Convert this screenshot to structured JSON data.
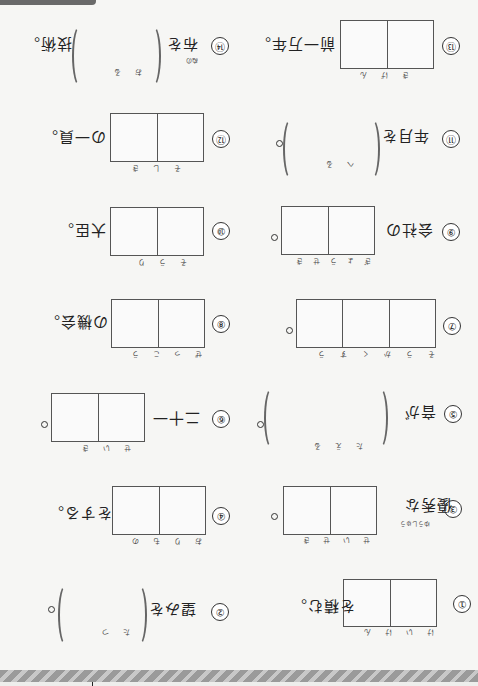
{
  "worksheet": {
    "orientation": "rotated-180",
    "problems": [
      {
        "num": "①",
        "before": "",
        "after": "を積む。",
        "answer_type": "boxes",
        "boxes": 2,
        "reading": [
          "け",
          "い",
          "け",
          "ん"
        ]
      },
      {
        "num": "②",
        "before": "望みを",
        "after": "。",
        "answer_type": "parens",
        "reading": [
          "た",
          "つ"
        ]
      },
      {
        "num": "③",
        "before": "優秀な",
        "before_ruby": "ゆうしゅう",
        "after": "。",
        "answer_type": "boxes",
        "boxes": 2,
        "reading": [
          "せ",
          "い",
          "せ",
          "き"
        ]
      },
      {
        "num": "④",
        "before": "",
        "after": "をする。",
        "answer_type": "boxes",
        "boxes": 2,
        "reading": [
          "お",
          "り",
          "も",
          "の"
        ]
      },
      {
        "num": "⑤",
        "before": "音が",
        "after": "。",
        "answer_type": "parens",
        "reading": [
          "た",
          "え",
          "る"
        ]
      },
      {
        "num": "⑥",
        "before": "二十一",
        "after": "。",
        "answer_type": "boxes",
        "boxes": 2,
        "reading": [
          "せ",
          "い",
          "き"
        ]
      },
      {
        "num": "⑦",
        "before": "",
        "after": "。",
        "answer_type": "boxes",
        "boxes": 3,
        "reading": [
          "そ",
          "う",
          "か",
          "く",
          "す",
          "う"
        ]
      },
      {
        "num": "⑧",
        "before": "",
        "after": "の機会。",
        "answer_type": "boxes",
        "boxes": 2,
        "reading": [
          "ぜ",
          "っ",
          "こ",
          "う"
        ]
      },
      {
        "num": "⑨",
        "before": "会社の",
        "after": "。",
        "answer_type": "boxes",
        "boxes": 2,
        "reading": [
          "ぎょう",
          "せ",
          "き"
        ]
      },
      {
        "num": "⑩",
        "before": "",
        "after": "大臣。",
        "answer_type": "boxes",
        "boxes": 2,
        "reading": [
          "そ",
          "う",
          "り"
        ]
      },
      {
        "num": "⑪",
        "before": "年月を",
        "after": "。",
        "answer_type": "parens",
        "reading": [
          "へ",
          "る"
        ]
      },
      {
        "num": "⑫",
        "before": "",
        "after": "の一員。",
        "answer_type": "boxes",
        "boxes": 2,
        "reading": [
          "そ",
          "し",
          "き"
        ]
      },
      {
        "num": "⑬",
        "before": "",
        "after": "前一万年。",
        "answer_type": "boxes",
        "boxes": 2,
        "reading": [
          "き",
          "げ",
          "ん"
        ]
      },
      {
        "num": "⑭",
        "before": "布を",
        "before_ruby": "ぬの",
        "after": "技術。",
        "answer_type": "parens",
        "reading": [
          "お",
          "る"
        ]
      }
    ]
  },
  "colors": {
    "paper": "#f6f6f4",
    "line": "#555555",
    "stripe_dark": "#9a9a9a",
    "stripe_light": "#c8c8c8",
    "tab": "#6a6a6a"
  }
}
